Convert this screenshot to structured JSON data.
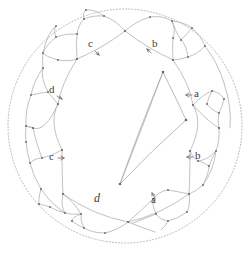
{
  "figure": {
    "type": "hyperbolic-tessellation",
    "model": "poincare-disk",
    "title": "",
    "colors": {
      "background": "#ffffff",
      "boundary_circle": "#b9aab0",
      "geodesic_arc": "#b3aaa8",
      "core_polygon": "#b0a8a6",
      "vertex_dot": "#6e6460",
      "label_text": "#3c3c3c",
      "arrow": "#6e6460"
    },
    "disk": {
      "center_x": 125,
      "center_y": 126,
      "radius": 117,
      "boundary_style": "dotted"
    }
  },
  "labels": [
    {
      "id": "label-c-top",
      "text": "c",
      "x": 92,
      "y": 44,
      "italic": false,
      "arrow": "down-right"
    },
    {
      "id": "label-b-top",
      "text": "b",
      "x": 153,
      "y": 44,
      "italic": false,
      "arrow": "up-left"
    },
    {
      "id": "label-a-right",
      "text": "a",
      "x": 194,
      "y": 88,
      "italic": false,
      "arrow": "left"
    },
    {
      "id": "label-d-left",
      "text": "d",
      "x": 50,
      "y": 88,
      "italic": false,
      "arrow": "down-right"
    },
    {
      "id": "label-c-left",
      "text": "c",
      "x": 50,
      "y": 152,
      "italic": false,
      "arrow": "right"
    },
    {
      "id": "label-b-right",
      "text": "b",
      "x": 195,
      "y": 150,
      "italic": false,
      "arrow": "left"
    },
    {
      "id": "label-d-bottom",
      "text": "d",
      "x": 95,
      "y": 193,
      "italic": true,
      "arrow": "none"
    },
    {
      "id": "label-a-bottom",
      "text": "a",
      "x": 152,
      "y": 193,
      "italic": false,
      "arrow": "up-left"
    }
  ],
  "generators": [
    "a",
    "b",
    "c",
    "d"
  ],
  "core_polygon": {
    "name": "fundamental-domain",
    "vertices": [
      {
        "x": 163,
        "y": 72
      },
      {
        "x": 186,
        "y": 120
      },
      {
        "x": 120,
        "y": 184
      }
    ]
  },
  "vertex_points": [
    {
      "x": 125,
      "y": 31
    },
    {
      "x": 163,
      "y": 72
    },
    {
      "x": 186,
      "y": 120
    },
    {
      "x": 120,
      "y": 184
    },
    {
      "x": 62,
      "y": 59
    },
    {
      "x": 192,
      "y": 60
    },
    {
      "x": 33,
      "y": 128
    },
    {
      "x": 219,
      "y": 128
    },
    {
      "x": 62,
      "y": 193
    },
    {
      "x": 193,
      "y": 193
    },
    {
      "x": 128,
      "y": 222
    }
  ]
}
